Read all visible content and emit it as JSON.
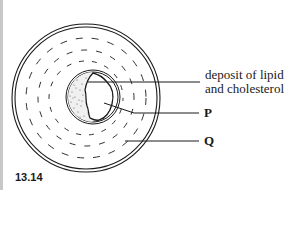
{
  "figure": {
    "number": "13.14",
    "labels": {
      "deposit_line1": "deposit of lipid",
      "deposit_line2": "and cholesterol",
      "p": "P",
      "q": "Q"
    }
  },
  "colors": {
    "line": "#1a1a1a",
    "background": "#ffffff",
    "left_bar": "#c8c8c8"
  }
}
